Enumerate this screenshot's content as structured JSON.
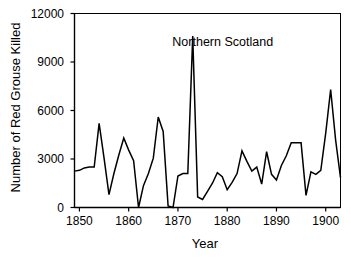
{
  "figure": {
    "ylabel": "Number of Red Grouse Killed",
    "xlabel": "Year",
    "annotation": "Northern Scotland",
    "line_color": "#000000",
    "background_color": "#ffffff",
    "axis_color": "#000000"
  },
  "axes": {
    "y_ticks": [
      "0",
      "3000",
      "6000",
      "9000",
      "12000"
    ],
    "x_ticks": [
      "1850",
      "1860",
      "1870",
      "1880",
      "1890",
      "1900"
    ]
  },
  "chart_data": {
    "type": "line",
    "title": "",
    "subtitle": "",
    "xlabel": "Year",
    "ylabel": "Number of Red Grouse Killed",
    "annotations": [
      {
        "text": "Northern Scotland",
        "x": 1878,
        "y": 10200
      }
    ],
    "legend": null,
    "legend_position": "none",
    "grid": false,
    "xlim": [
      1849,
      1903
    ],
    "ylim": [
      0,
      12000
    ],
    "x_ticks": [
      1850,
      1860,
      1870,
      1880,
      1890,
      1900
    ],
    "y_ticks": [
      0,
      3000,
      6000,
      9000,
      12000
    ],
    "series": [
      {
        "name": "Red grouse killed",
        "color": "#000000",
        "x": [
          1849,
          1850,
          1851,
          1852,
          1853,
          1854,
          1855,
          1856,
          1857,
          1858,
          1859,
          1860,
          1861,
          1862,
          1863,
          1864,
          1865,
          1866,
          1867,
          1868,
          1869,
          1870,
          1871,
          1872,
          1873,
          1874,
          1875,
          1876,
          1877,
          1878,
          1879,
          1880,
          1881,
          1882,
          1883,
          1884,
          1885,
          1886,
          1887,
          1888,
          1889,
          1890,
          1891,
          1892,
          1893,
          1894,
          1895,
          1896,
          1897,
          1898,
          1899,
          1900,
          1901,
          1902,
          1903
        ],
        "values": [
          2250,
          2300,
          2450,
          2500,
          2500,
          5200,
          3050,
          800,
          2100,
          3250,
          4300,
          3550,
          2900,
          0,
          1350,
          2100,
          3050,
          5600,
          4700,
          100,
          0,
          1950,
          2100,
          2100,
          10600,
          650,
          500,
          1000,
          1500,
          2150,
          1900,
          1100,
          1550,
          2100,
          3500,
          2850,
          2250,
          2500,
          1450,
          3450,
          2050,
          1700,
          2600,
          3200,
          4000,
          4000,
          4000,
          750,
          2200,
          2050,
          2300,
          4600,
          7300,
          4200,
          1850
        ]
      }
    ]
  }
}
